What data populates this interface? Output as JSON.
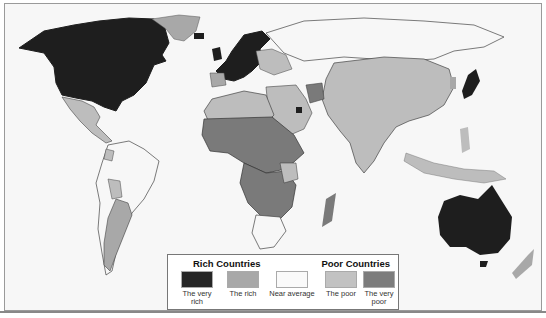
{
  "map": {
    "type": "choropleth-world",
    "colors": {
      "very_rich": "#1e1e1e",
      "rich": "#a6a6a6",
      "near_average": "#f7f7f7",
      "poor": "#bdbdbd",
      "very_poor": "#7a7a7a",
      "ocean": "#f7f7f7",
      "border": "#444444"
    }
  },
  "legend": {
    "rich_heading": "Rich Countries",
    "poor_heading": "Poor Countries",
    "items": [
      {
        "label_line1": "The very",
        "label_line2": "rich",
        "color": "#262626"
      },
      {
        "label_line1": "The rich",
        "label_line2": "",
        "color": "#a8a8a8"
      },
      {
        "label_line1": "Near average",
        "label_line2": "",
        "color": "#fafafa"
      },
      {
        "label_line1": "The poor",
        "label_line2": "",
        "color": "#c2c2c2"
      },
      {
        "label_line1": "The very",
        "label_line2": "poor",
        "color": "#7c7c7c"
      }
    ]
  }
}
